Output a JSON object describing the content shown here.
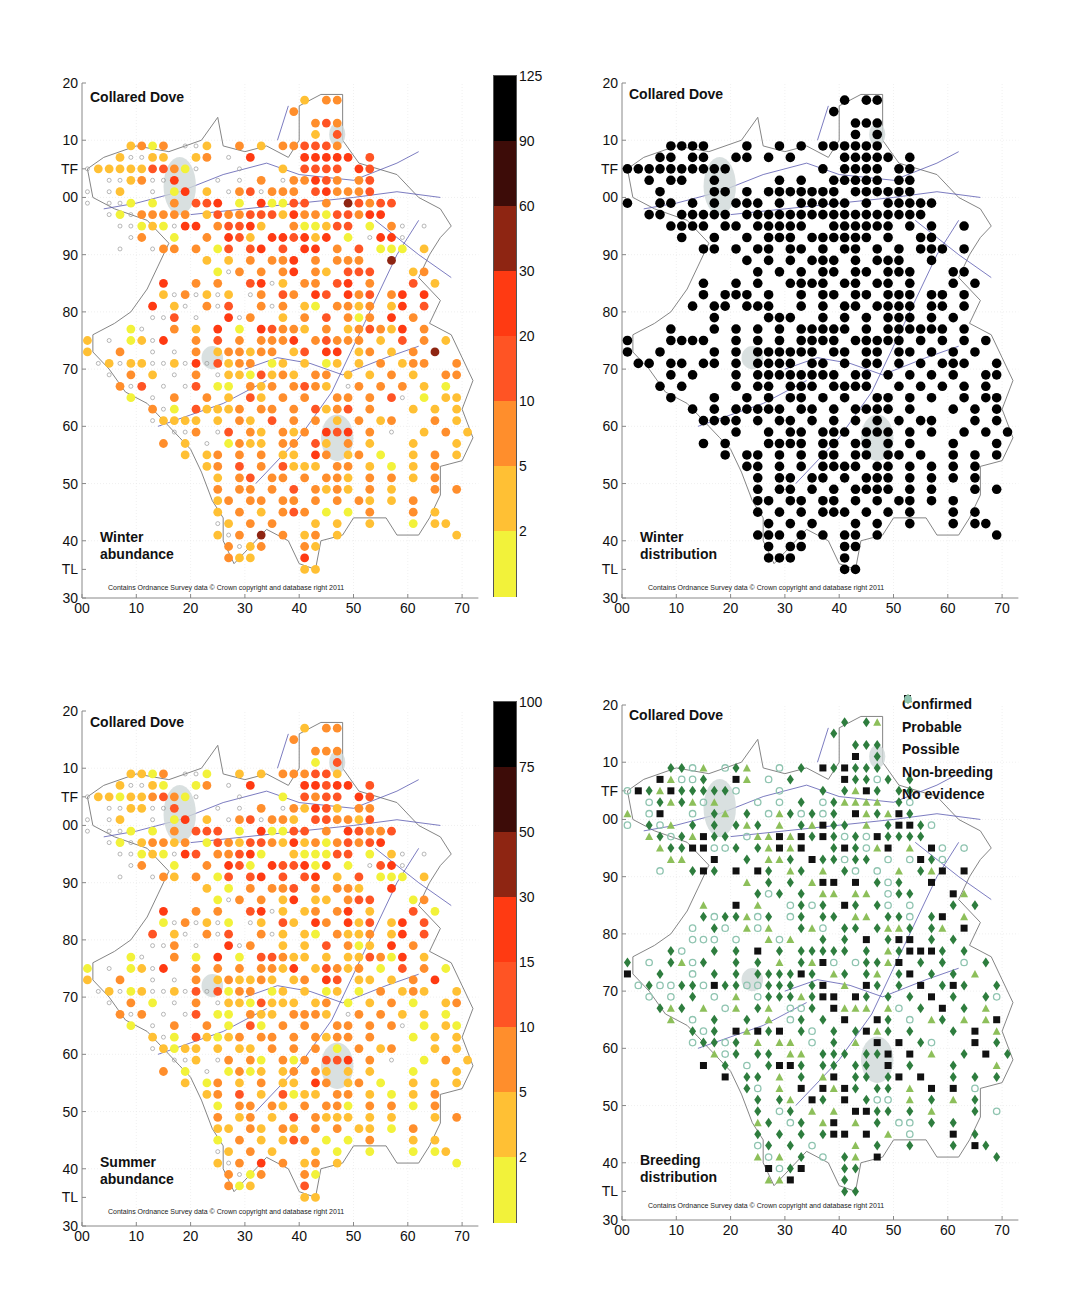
{
  "species": "Collared Dove",
  "credit": "Contains Ordnance Survey data © Crown copyright and database right 2011",
  "axes": {
    "y_ticks": [
      "20",
      "10",
      "TF",
      "00",
      "90",
      "80",
      "70",
      "60",
      "50",
      "40",
      "TL",
      "30"
    ],
    "y_values": [
      120,
      110,
      105,
      100,
      90,
      80,
      70,
      60,
      50,
      40,
      35,
      30
    ],
    "x_ticks": [
      "00",
      "10",
      "20",
      "30",
      "40",
      "50",
      "60",
      "70"
    ],
    "x_values": [
      0,
      10,
      20,
      30,
      40,
      50,
      60,
      70
    ]
  },
  "panels": {
    "winter_abundance": {
      "title": "Collared Dove",
      "subtitle_line1": "Winter",
      "subtitle_line2": "abundance"
    },
    "winter_distribution": {
      "title": "Collared Dove",
      "subtitle_line1": "Winter",
      "subtitle_line2": "distribution"
    },
    "summer_abundance": {
      "title": "Collared Dove",
      "subtitle_line1": "Summer",
      "subtitle_line2": "abundance"
    },
    "breeding_distribution": {
      "title": "Collared Dove",
      "subtitle_line1": "Breeding",
      "subtitle_line2": "distribution"
    }
  },
  "colorbars": {
    "winter": {
      "labels": [
        "125",
        "90",
        "60",
        "30",
        "20",
        "10",
        "5",
        "2"
      ],
      "colors": [
        "#000000",
        "#3d0c08",
        "#8e2512",
        "#ff3a12",
        "#ff5424",
        "#ff8e2c",
        "#ffc034",
        "#f2f23a"
      ]
    },
    "summer": {
      "labels": [
        "100",
        "75",
        "50",
        "30",
        "15",
        "10",
        "5",
        "2"
      ],
      "colors": [
        "#000000",
        "#3d0c08",
        "#8e2512",
        "#ff3a12",
        "#ff5424",
        "#ff8e2c",
        "#ffc034",
        "#f2f23a"
      ]
    }
  },
  "breeding_legend": [
    {
      "label": "Confirmed",
      "symbol": "square",
      "color": "#111111"
    },
    {
      "label": "Probable",
      "symbol": "diamond",
      "color": "#2e7d3e"
    },
    {
      "label": "Possible",
      "symbol": "triangle",
      "color": "#8dbf5a"
    },
    {
      "label": "Non-breeding",
      "symbol": "dot",
      "color": "#8fc4b0"
    },
    {
      "label": "No evidence",
      "symbol": "ring",
      "color": "#8fc4b0"
    }
  ],
  "chart_data": [
    {
      "type": "scatter",
      "title": "Collared Dove — Winter abundance",
      "xlabel": "Easting (km, TF/TL grid)",
      "ylabel": "Northing (km)",
      "xlim": [
        0,
        73
      ],
      "ylim": [
        30,
        120
      ],
      "note": "Tetrad grid (2km), easting = 1+2*col, northing = 117-2*row. Mask chars: . empty, o surveyed none, 1-8 abundance class (1:<2, 2:2-5, 3:5-10, 4:10-20, 5:20-30, 6:30-60, 7:60-90, 8:90-125)",
      "colorbar": [
        2,
        5,
        10,
        20,
        30,
        60,
        90,
        125
      ]
    },
    {
      "type": "scatter",
      "title": "Collared Dove — Winter distribution",
      "legend": [
        "present"
      ]
    },
    {
      "type": "scatter",
      "title": "Collared Dove — Summer abundance",
      "colorbar": [
        2,
        5,
        10,
        15,
        30,
        50,
        75,
        100
      ]
    },
    {
      "type": "scatter",
      "title": "Collared Dove — Breeding distribution",
      "legend": [
        "Confirmed",
        "Probable",
        "Possible",
        "Non-breeding",
        "No evidence"
      ]
    }
  ],
  "grid": {
    "rows": [
      "....................2.33............",
      "...................3................",
      ".....................343............",
      ".....................2.4............",
      "....2313.oo2..3.2.334443............",
      "...2oo22..23.o.5....55555.4.........",
      "o222224431o...o...2.4444.54.........",
      "..oo23oo5...o.o.3.o33543.34.........",
      "o.o2..o.15.2.o34o333.453334.........",
      "o.oo1.1.3.445.1.51144.3.64344.......",
      "..o1o33333.24334442533144355........",
      "...oo121o55.34452..311244.1.3o.o....",
      "....o3..1..3.542.554525.1.o55o......",
      "...o..o33.3.14.45.4.55.3.4.111.2....",
      "...........2.2.3.335.3.333..6.......",
      "............1o3.3.35.32.444...23....",
      ".......5..3.3..45o2.33.45.3...4.2...",
      ".......2o3o2o2.o3.43.54.534.35.5....",
      "......5.2o.3o4..3o3.21.3323.25.4....",
      "......oo4.o..5o3..2.3.4.313.5.3.....",
      "....1o..3.2.5.1.54332.3.234325.3....",
      "2.o.12o5..3.4.3.3335.34333.2.4.3.2..",
      "2..3..o.o.3.233233.24.55.23.2.3.6...",
      ".o2o22oo2o5o4233.12.2.12.2.3.233..3.",
      "..o.3.2.o.3.o2214232.33.2.2.3.2..33.",
      "...3o4.o.o4.11.323.3432.o3.3.3.2.1..",
      "....1.o.3..3.2.42.3.3..33.3.4o.1.22.",
      "......3o1.42223.33.3.4234.3...2.2.2.",
      "......o2222.2.32.4.3.3.2.3.23...3.2.",
      "........oo3.o4.32.323.545.3.o..2.3.2",
      ".......3.2.o.1322.33.42.3.2...2...2.",
      ".........2.23.3.3.22.53.23.1..2.3.2.",
      "...........23.4.3.4222.33.2.1.2.3...",
      "............2.34.33.3.332.3.3.2.3...",
      "............3.33.3.4.3232.3.2...3.3.",
      "............23.33.33.3.3.32.2.3.....",
      "............2.3.2.343.1.1.3...3.2...",
      "............o2.3.3...2.2..2...1.22..",
      "............2o3.6.3.23.2..........2.",
      ".............3o23...32..............",
      ".............322....5...............",
      "....................22.............."
    ]
  }
}
